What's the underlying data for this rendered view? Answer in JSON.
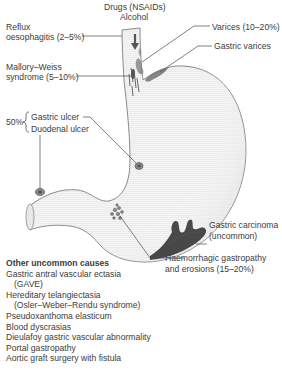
{
  "diagram": {
    "type": "anatomical-illustration",
    "colors": {
      "organ_fill": "#f2f2f2",
      "organ_outline": "#8a8a8a",
      "lesion": "#6e6e6e",
      "carcinoma": "#2a2a2a",
      "leader_line": "#4a4a4a",
      "text": "#3c3c3c"
    },
    "labels": {
      "drugs": "Drugs (NSAIDs)",
      "alcohol": "Alcohol",
      "reflux_line1": "Reflux",
      "reflux_line2": "oesophagitis (2–5%)",
      "mallory_line1": "Mallory–Weiss",
      "mallory_line2": "syndrome (5–10%)",
      "ulcer_percent": "50%",
      "gastric_ulcer": "Gastric ulcer",
      "duodenal_ulcer": "Duodenal ulcer",
      "varices": "Varices (10–20%)",
      "gastric_varices": "Gastric varices",
      "carcinoma_line1": "Gastric carcinoma",
      "carcinoma_line2": "(uncommon)",
      "haem_line1": "Haemorrhagic gastropathy",
      "haem_line2": "and erosions (15–20%)"
    },
    "other_causes": {
      "heading": "Other uncommon causes",
      "items": [
        {
          "text": "Gastric antral vascular ectasia",
          "indent": false
        },
        {
          "text": "(GAVE)",
          "indent": true
        },
        {
          "text": "Hereditary telangiectasia",
          "indent": false
        },
        {
          "text": "(Osler–Weber–Rendu syndrome)",
          "indent": true
        },
        {
          "text": "Pseudoxanthoma elasticum",
          "indent": false
        },
        {
          "text": "Blood dyscrasias",
          "indent": false
        },
        {
          "text": "Dieulafoy gastric vascular abnormality",
          "indent": false
        },
        {
          "text": "Portal gastropathy",
          "indent": false
        },
        {
          "text": "Aortic graft surgery with fistula",
          "indent": false
        }
      ]
    }
  }
}
